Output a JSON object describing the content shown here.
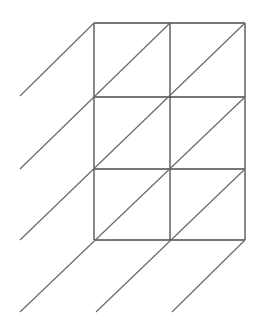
{
  "diagram": {
    "type": "lattice-multiplication-grid",
    "columns": 2,
    "rows": 3,
    "colors": {
      "background": "#ffffff",
      "grid": "#4a4a4a",
      "diagonal": "#6a6a6a"
    },
    "grid": {
      "x": [
        94,
        170,
        245
      ],
      "y": [
        23,
        97,
        169,
        240
      ]
    },
    "diagonals": [
      {
        "x1": 94,
        "y1": 23,
        "x2": 20,
        "y2": 96
      },
      {
        "x1": 170,
        "y1": 23,
        "x2": 20,
        "y2": 169
      },
      {
        "x1": 245,
        "y1": 23,
        "x2": 20,
        "y2": 240
      },
      {
        "x1": 245,
        "y1": 97,
        "x2": 20,
        "y2": 312
      },
      {
        "x1": 245,
        "y1": 169,
        "x2": 96,
        "y2": 312
      },
      {
        "x1": 245,
        "y1": 240,
        "x2": 172,
        "y2": 312
      }
    ]
  }
}
